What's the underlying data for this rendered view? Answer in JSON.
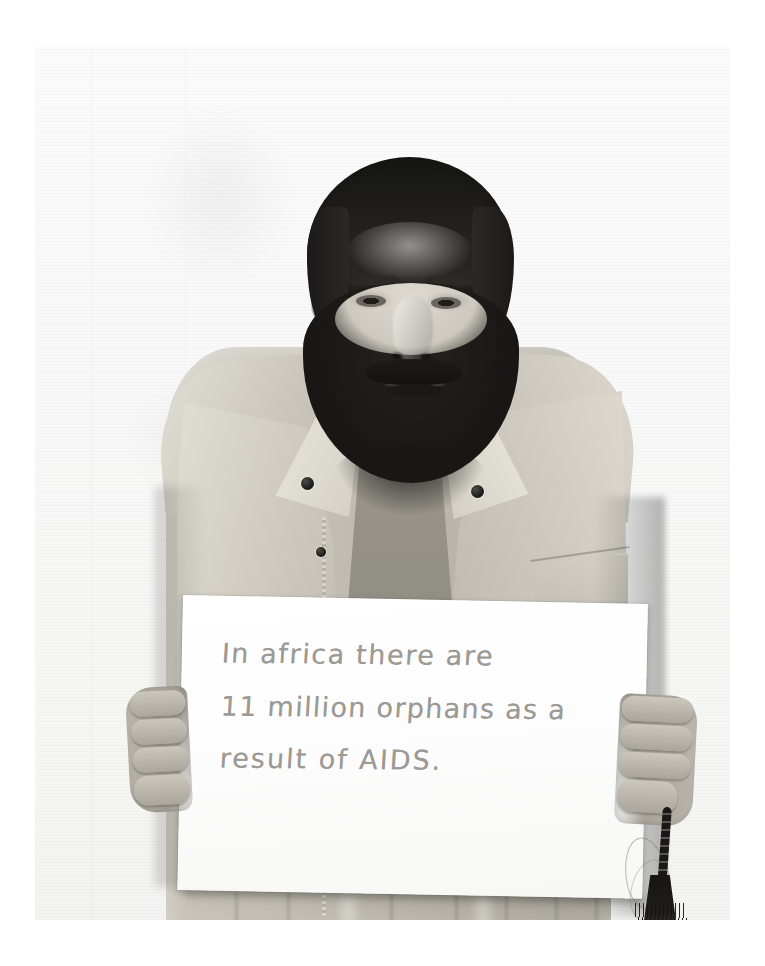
{
  "page": {
    "background_color": "#ffffff",
    "medium": "black-and-white photograph",
    "caption": ""
  },
  "photo": {
    "title": "Portrait of a bearded man holding a handwritten sign",
    "background_color": "#f8f8f7",
    "tone": "monochrome",
    "frame": {
      "left": 35,
      "top": 47,
      "width": 695,
      "height": 873
    }
  },
  "subject": {
    "description": "Middle-aged man with dark hair and a full dark beard, facing the camera",
    "clothing": "light khaki sleeveless vest with dark snap buttons, zipper and chest pocket, over a darker shirt",
    "accessory": "dark prayer beads with tassel held in the right hand"
  },
  "sign": {
    "material": "white card",
    "ink": "gray pencil handwriting",
    "ink_color": "#9d9a95",
    "lines": [
      "In africa there are",
      "11 million orphans as a",
      "result of AIDS."
    ],
    "full_text": "In africa there are 11 million orphans as a result of AIDS."
  }
}
